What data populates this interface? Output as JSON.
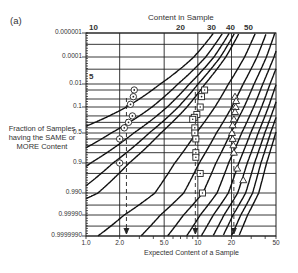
{
  "chart_data": {
    "type": "line",
    "panel_label": "(a)",
    "title": "Content in Sample",
    "xlabel": "Expected Content of a Sample",
    "ylabel": "Fraction of Samples having the SAME or MORE Content",
    "x_scale": "log",
    "xlim": [
      1.0,
      50
    ],
    "x_ticks": [
      "1.0",
      "2.0",
      "5.0",
      "10",
      "20",
      "50"
    ],
    "y_scale": "probability",
    "y_ticks": [
      "0.000001",
      "0.0001",
      "0.01",
      "0.1",
      "0.5",
      "0.9",
      "0.990",
      "0.99990",
      "0.9999990"
    ],
    "top_curve_labels": [
      "10",
      "20",
      "30",
      "40",
      "50"
    ],
    "inner_curve_labels": [
      "5"
    ],
    "grid": true,
    "curves_description": "Family of Poisson cumulative curves for sample content values (1..50); each curve descends left-to-right.",
    "series": [
      {
        "name": "circles",
        "marker": "circle-dot",
        "expected_content_line": 2.3,
        "points": [
          {
            "x": 2.7,
            "y_label": "0.02"
          },
          {
            "x": 2.65,
            "y_label": "0.04"
          },
          {
            "x": 2.5,
            "y_label": "0.08"
          },
          {
            "x": 2.6,
            "y_label": "0.2"
          },
          {
            "x": 2.4,
            "y_label": "0.3"
          },
          {
            "x": 2.2,
            "y_label": "0.4"
          },
          {
            "x": 2.0,
            "y_label": "0.6"
          },
          {
            "x": 2.0,
            "y_label": "0.9"
          }
        ]
      },
      {
        "name": "squares",
        "marker": "square-dot",
        "expected_content_line": 9.5,
        "points": [
          {
            "x": 11.5,
            "y_label": "0.02"
          },
          {
            "x": 10.8,
            "y_label": "0.04"
          },
          {
            "x": 10.5,
            "y_label": "0.1"
          },
          {
            "x": 9.8,
            "y_label": "0.18"
          },
          {
            "x": 9.3,
            "y_label": "0.22"
          },
          {
            "x": 9.0,
            "y_label": "0.25"
          },
          {
            "x": 9.4,
            "y_label": "0.4"
          },
          {
            "x": 9.4,
            "y_label": "0.5"
          },
          {
            "x": 9.6,
            "y_label": "0.6"
          },
          {
            "x": 9.6,
            "y_label": "0.8"
          },
          {
            "x": 9.6,
            "y_label": "0.85"
          },
          {
            "x": 10.5,
            "y_label": "0.95"
          },
          {
            "x": 11.0,
            "y_label": "0.99"
          }
        ]
      },
      {
        "name": "triangles",
        "marker": "triangle",
        "expected_content_line": 21,
        "points": [
          {
            "x": 21.5,
            "y_label": "0.04"
          },
          {
            "x": 22,
            "y_label": "0.06"
          },
          {
            "x": 21.8,
            "y_label": "0.1"
          },
          {
            "x": 21.5,
            "y_label": "0.15"
          },
          {
            "x": 21,
            "y_label": "0.25"
          },
          {
            "x": 20.5,
            "y_label": "0.35"
          },
          {
            "x": 20.2,
            "y_label": "0.5"
          },
          {
            "x": 20.5,
            "y_label": "0.6"
          },
          {
            "x": 20.8,
            "y_label": "0.7"
          },
          {
            "x": 21.0,
            "y_label": "0.8"
          },
          {
            "x": 22.5,
            "y_label": "0.93"
          },
          {
            "x": 25.5,
            "y_label": "0.97"
          }
        ]
      }
    ]
  }
}
